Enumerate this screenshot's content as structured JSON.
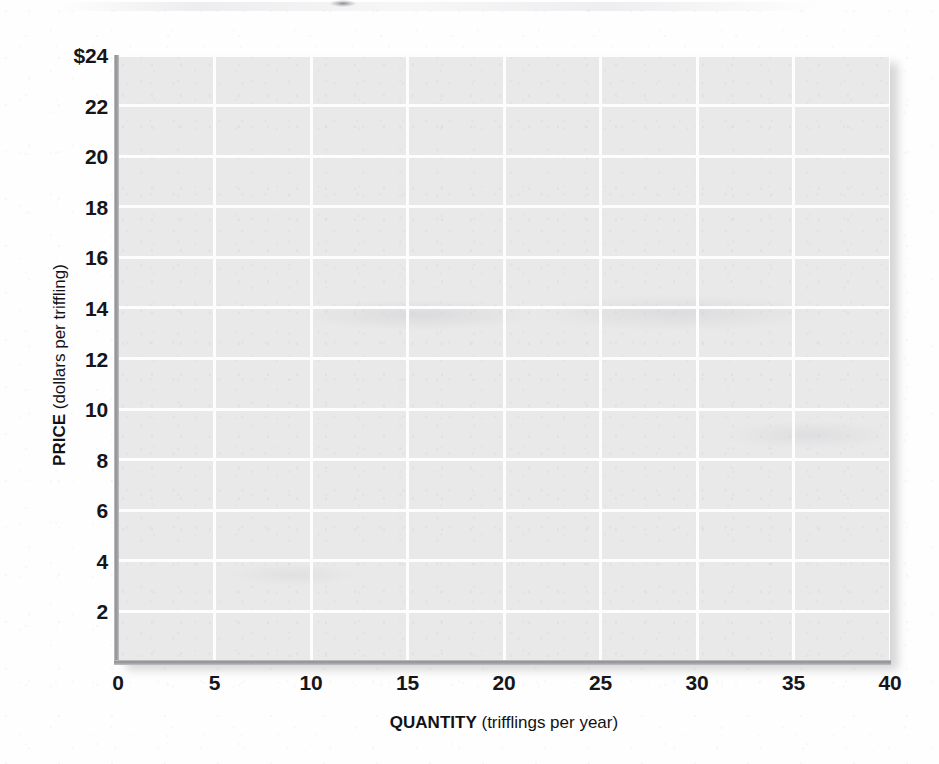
{
  "chart_data": {
    "type": "line",
    "title": "",
    "subtitle": "",
    "xlabel_bold": "QUANTITY",
    "xlabel_paren": "(trifflings per year)",
    "ylabel_bold": "PRICE",
    "ylabel_paren": "(dollars per triffling)",
    "xlabel": "QUANTITY (trifflings per year)",
    "ylabel": "PRICE (dollars per triffling)",
    "xlim": [
      0,
      40
    ],
    "ylim": [
      0,
      24
    ],
    "xticks": [
      0,
      5,
      10,
      15,
      20,
      25,
      30,
      35,
      40
    ],
    "xtick_labels": [
      "0",
      "5",
      "10",
      "15",
      "20",
      "25",
      "30",
      "35",
      "40"
    ],
    "yticks": [
      2,
      4,
      6,
      8,
      10,
      12,
      14,
      16,
      18,
      20,
      22,
      24
    ],
    "ytick_labels": [
      "2",
      "4",
      "6",
      "8",
      "10",
      "12",
      "14",
      "16",
      "18",
      "20",
      "22",
      "24"
    ],
    "ytick_top_label": "$24",
    "grid": true,
    "grid_color": "#fdfdfd",
    "plot_background": "#e9e9e9",
    "axis_color": "#8e8e93",
    "legend": [],
    "series": [],
    "annotations": [],
    "note": "blank grid — no data plotted"
  },
  "axis": {
    "y": {
      "bold": "PRICE",
      "paren": "(dollars per triffling)"
    },
    "x": {
      "bold": "QUANTITY",
      "paren": "(trifflings per year)"
    }
  }
}
